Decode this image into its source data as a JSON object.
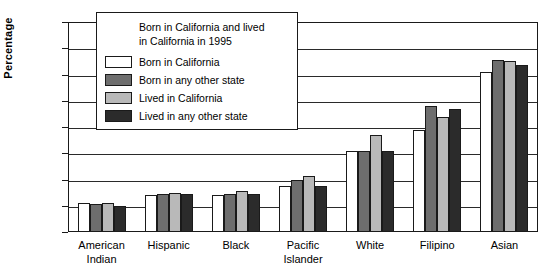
{
  "chart_data": {
    "type": "bar",
    "title": "",
    "xlabel": "",
    "ylabel": "Percentage",
    "ylim": [
      0,
      80
    ],
    "ytick_step": 10,
    "yticks": [
      0,
      10,
      20,
      30,
      40,
      50,
      60,
      70,
      80
    ],
    "grid": true,
    "legend_position": "upper-left-inside",
    "legend_title": "Born in California and lived in California in 1995",
    "legend_title_line1": "Born in California and lived",
    "legend_title_line2": "in California in 1995",
    "categories": [
      "American\nIndian",
      "Hispanic",
      "Black",
      "Pacific\nIslander",
      "White",
      "Filipino",
      "Asian"
    ],
    "series": [
      {
        "name": "Born in California",
        "color": "#ffffff",
        "values": [
          11,
          14,
          14,
          17.5,
          31,
          39,
          61
        ]
      },
      {
        "name": "Born in any other state",
        "color": "#6e6e6e",
        "values": [
          10.5,
          14.5,
          14.5,
          20,
          31,
          48,
          65.5
        ]
      },
      {
        "name": "Lived in California",
        "color": "#b9b9b9",
        "values": [
          11,
          15,
          15.5,
          21.5,
          37,
          44,
          65
        ]
      },
      {
        "name": "Lived in any other state",
        "color": "#2b2b2b",
        "values": [
          10,
          14.5,
          14.5,
          17.5,
          31,
          47,
          63.5
        ]
      }
    ]
  }
}
